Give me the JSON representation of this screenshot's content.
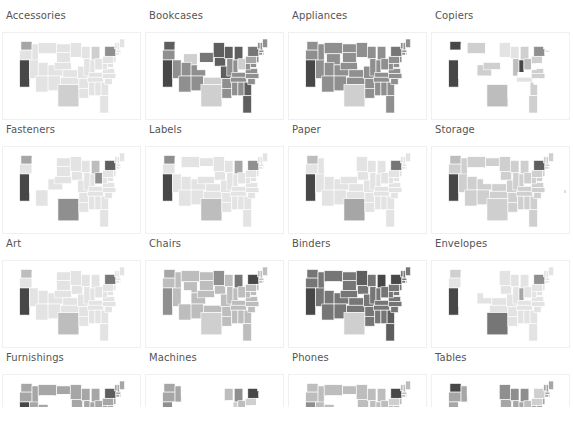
{
  "dashboard": {
    "type": "small-multiples choropleth map grid",
    "footer_text": ""
  },
  "colors": {
    "scale": [
      "#ffffff",
      "#e3e3e3",
      "#cfcfcf",
      "#bdbdbd",
      "#a6a6a6",
      "#8f8f8f",
      "#767676",
      "#5e5e5e",
      "#474747"
    ],
    "title": "#555555",
    "border": "#f0f0f0"
  },
  "panels": [
    {
      "title": "Accessories",
      "base": 1,
      "hot": {
        "CA": 8,
        "WA": 4,
        "NY": 5,
        "MT": 1,
        "WY": 0,
        "IA": 0,
        "TX": 2,
        "MI": 2
      }
    },
    {
      "title": "Bookcases",
      "base": 5,
      "hot": {
        "CA": 8,
        "WA": 7,
        "NY": 6,
        "MT": 0,
        "ID": 0,
        "WY": 2,
        "ND": 0,
        "SD": 6,
        "NE": 0,
        "KS": 0,
        "TX": 2,
        "OK": 2,
        "IA": 7,
        "MO": 7,
        "MI": 7,
        "WI": 7,
        "MN": 7,
        "FL": 7,
        "GA": 7,
        "OH": 2,
        "PA": 4
      }
    },
    {
      "title": "Appliances",
      "base": 5,
      "hot": {
        "CA": 8,
        "TX": 2,
        "NY": 6,
        "WY": 5,
        "IA": 0,
        "KS": 5,
        "SD": 5
      }
    },
    {
      "title": "Copiers",
      "base": 0,
      "hot": {
        "CA": 8,
        "WA": 8,
        "MT": 2,
        "CO": 2,
        "NE": 2,
        "TX": 3,
        "MN": 1,
        "WI": 1,
        "MI": 2,
        "IN": 8,
        "OH": 3,
        "IL": 3,
        "NY": 5,
        "PA": 2,
        "GA": 2,
        "FL": 2,
        "VA": 2,
        "NC": 2,
        "TN": 1,
        "MA": 1
      }
    },
    {
      "title": "Fasteners",
      "base": 1,
      "hot": {
        "CA": 8,
        "WA": 4,
        "TX": 5,
        "NY": 7,
        "OH": 5,
        "MI": 3,
        "NV": 0,
        "ID": 0,
        "UT": 0,
        "WY": 0,
        "MT": 0,
        "NM": 0,
        "OK": 0,
        "KS": 0
      }
    },
    {
      "title": "Labels",
      "base": 1,
      "hot": {
        "CA": 8,
        "WA": 5,
        "NY": 5,
        "TX": 3,
        "MI": 4,
        "ID": 0,
        "WY": 0,
        "SD": 0
      }
    },
    {
      "title": "Paper",
      "base": 1,
      "hot": {
        "CA": 8,
        "WA": 3,
        "NY": 6,
        "TX": 4,
        "MT": 0,
        "ND": 0,
        "SD": 0,
        "WY": 0
      }
    },
    {
      "title": "Storage",
      "base": 2,
      "hot": {
        "CA": 8,
        "NY": 7,
        "TX": 2,
        "WA": 3,
        "WY": 0,
        "SD": 0,
        "NE": 0
      }
    },
    {
      "title": "Art",
      "base": 1,
      "hot": {
        "CA": 8,
        "WA": 3,
        "NY": 6,
        "TX": 3,
        "MT": 0,
        "ID": 0,
        "WY": 0,
        "NV": 1
      }
    },
    {
      "title": "Chairs",
      "base": 3,
      "hot": {
        "CA": 5,
        "NY": 8,
        "TX": 2,
        "WA": 4,
        "UT": 0,
        "CO": 3,
        "KS": 0,
        "MI": 6,
        "MN": 5,
        "PA": 3
      }
    },
    {
      "title": "Binders",
      "base": 6,
      "hot": {
        "CA": 8,
        "NY": 8,
        "MI": 8,
        "TX": 2,
        "WY": 0,
        "WA": 6,
        "MN": 7,
        "FL": 7,
        "GA": 7
      }
    },
    {
      "title": "Envelopes",
      "base": 1,
      "hot": {
        "CA": 8,
        "WA": 2,
        "TX": 6,
        "NY": 5,
        "ID": 0,
        "MT": 0,
        "NV": 0,
        "UT": 0,
        "WY": 0,
        "AZ": 0,
        "NM": 0,
        "ND": 0,
        "SD": 0,
        "NE": 0,
        "IN": 4
      }
    },
    {
      "title": "Furnishings",
      "base": 4,
      "hot": {
        "CA": 8,
        "NY": 7,
        "WY": 0,
        "SD": 0,
        "NE": 0,
        "CO": 0,
        "MI": 4
      }
    },
    {
      "title": "Machines",
      "base": 0,
      "hot": {
        "WA": 4,
        "OR": 4,
        "ID": 4,
        "CA": 5,
        "NY": 8,
        "MI": 5,
        "OH": 3,
        "IN": 2,
        "PA": 2,
        "KS": 2,
        "WI": 3
      }
    },
    {
      "title": "Phones",
      "base": 3,
      "hot": {
        "CA": 5,
        "NY": 8,
        "WY": 0,
        "SD": 0,
        "NE": 0,
        "CO": 0,
        "PA": 2
      }
    },
    {
      "title": "Tables",
      "base": 4,
      "hot": {
        "WA": 8,
        "MT": 0,
        "WY": 0,
        "ND": 0,
        "SD": 0,
        "NE": 0,
        "CO": 0,
        "UT": 0,
        "NV": 0,
        "MN": 5,
        "WI": 5,
        "MI": 5,
        "PA": 2,
        "NY": 2,
        "OH": 3
      }
    }
  ],
  "states": [
    {
      "id": "WA",
      "x": 4,
      "y": 2,
      "w": 9,
      "h": 7
    },
    {
      "id": "OR",
      "x": 3,
      "y": 9,
      "w": 10,
      "h": 8
    },
    {
      "id": "CA",
      "x": 3,
      "y": 17,
      "w": 8,
      "h": 22
    },
    {
      "id": "ID",
      "x": 13,
      "y": 4,
      "w": 5,
      "h": 15
    },
    {
      "id": "NV",
      "x": 11,
      "y": 17,
      "w": 7,
      "h": 15
    },
    {
      "id": "MT",
      "x": 18,
      "y": 3,
      "w": 15,
      "h": 9
    },
    {
      "id": "WY",
      "x": 20,
      "y": 12,
      "w": 11,
      "h": 9
    },
    {
      "id": "UT",
      "x": 18,
      "y": 19,
      "w": 8,
      "h": 11
    },
    {
      "id": "AZ",
      "x": 16,
      "y": 30,
      "w": 10,
      "h": 13
    },
    {
      "id": "CO",
      "x": 26,
      "y": 21,
      "w": 12,
      "h": 9
    },
    {
      "id": "NM",
      "x": 26,
      "y": 30,
      "w": 10,
      "h": 12
    },
    {
      "id": "ND",
      "x": 33,
      "y": 4,
      "w": 11,
      "h": 7
    },
    {
      "id": "SD",
      "x": 33,
      "y": 11,
      "w": 11,
      "h": 8
    },
    {
      "id": "NE",
      "x": 31,
      "y": 19,
      "w": 14,
      "h": 6
    },
    {
      "id": "KS",
      "x": 38,
      "y": 25,
      "w": 12,
      "h": 6
    },
    {
      "id": "OK",
      "x": 36,
      "y": 31,
      "w": 15,
      "h": 6
    },
    {
      "id": "TX",
      "x": 34,
      "y": 37,
      "w": 17,
      "h": 18
    },
    {
      "id": "MN",
      "x": 44,
      "y": 3,
      "w": 9,
      "h": 12
    },
    {
      "id": "IA",
      "x": 45,
      "y": 15,
      "w": 9,
      "h": 7
    },
    {
      "id": "MO",
      "x": 50,
      "y": 22,
      "w": 9,
      "h": 10
    },
    {
      "id": "AR",
      "x": 51,
      "y": 32,
      "w": 8,
      "h": 8
    },
    {
      "id": "LA",
      "x": 51,
      "y": 40,
      "w": 8,
      "h": 8
    },
    {
      "id": "WI",
      "x": 53,
      "y": 6,
      "w": 7,
      "h": 10
    },
    {
      "id": "IL",
      "x": 55,
      "y": 16,
      "w": 5,
      "h": 14
    },
    {
      "id": "MI",
      "x": 61,
      "y": 6,
      "w": 7,
      "h": 11
    },
    {
      "id": "IN",
      "x": 60,
      "y": 17,
      "w": 4,
      "h": 10
    },
    {
      "id": "OH",
      "x": 64,
      "y": 16,
      "w": 6,
      "h": 9
    },
    {
      "id": "KY",
      "x": 59,
      "y": 27,
      "w": 11,
      "h": 4
    },
    {
      "id": "TN",
      "x": 58,
      "y": 31,
      "w": 13,
      "h": 4
    },
    {
      "id": "MS",
      "x": 59,
      "y": 35,
      "w": 5,
      "h": 11
    },
    {
      "id": "AL",
      "x": 64,
      "y": 35,
      "w": 5,
      "h": 11
    },
    {
      "id": "GA",
      "x": 69,
      "y": 35,
      "w": 6,
      "h": 11
    },
    {
      "id": "FL",
      "x": 68,
      "y": 46,
      "w": 7,
      "h": 14
    },
    {
      "id": "SC",
      "x": 72,
      "y": 32,
      "w": 6,
      "h": 5
    },
    {
      "id": "NC",
      "x": 70,
      "y": 28,
      "w": 11,
      "h": 4
    },
    {
      "id": "VA",
      "x": 70,
      "y": 24,
      "w": 10,
      "h": 4
    },
    {
      "id": "WV",
      "x": 70,
      "y": 20,
      "w": 4,
      "h": 5
    },
    {
      "id": "PA",
      "x": 70,
      "y": 14,
      "w": 9,
      "h": 6
    },
    {
      "id": "NY",
      "x": 72,
      "y": 6,
      "w": 9,
      "h": 8
    },
    {
      "id": "NJ",
      "x": 79,
      "y": 14,
      "w": 2,
      "h": 5
    },
    {
      "id": "MD",
      "x": 74,
      "y": 20,
      "w": 5,
      "h": 3
    },
    {
      "id": "VT",
      "x": 80,
      "y": 3,
      "w": 2,
      "h": 5
    },
    {
      "id": "NH",
      "x": 82,
      "y": 3,
      "w": 2,
      "h": 6
    },
    {
      "id": "ME",
      "x": 84,
      "y": 0,
      "w": 4,
      "h": 7
    },
    {
      "id": "MA",
      "x": 81,
      "y": 9,
      "w": 4,
      "h": 2
    },
    {
      "id": "CT",
      "x": 81,
      "y": 11,
      "w": 3,
      "h": 2
    },
    {
      "id": "RI",
      "x": 84,
      "y": 11,
      "w": 1,
      "h": 2
    }
  ]
}
